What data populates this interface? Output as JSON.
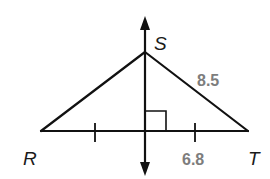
{
  "diagram": {
    "type": "triangle-with-perpendicular-bisector",
    "vertices": [
      {
        "id": "R",
        "label": "R"
      },
      {
        "id": "S",
        "label": "S"
      },
      {
        "id": "T",
        "label": "T"
      }
    ],
    "measurements": {
      "ST": "8.5",
      "half_RT": "6.8"
    },
    "marks": {
      "right_angle": true,
      "congruent_ticks": 2
    },
    "colors": {
      "line": "#111111",
      "measure_label": "#7d7d7d",
      "background": "#ffffff"
    }
  }
}
